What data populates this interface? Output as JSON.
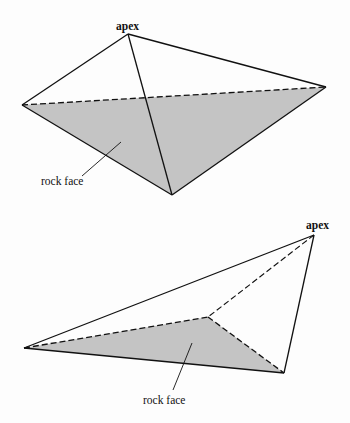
{
  "colors": {
    "face_fill": "#c4c4c4",
    "line": "#111111",
    "background": "#fdfdfd"
  },
  "figures": [
    {
      "name": "top-pyramid",
      "apex_label": "apex",
      "rock_face_label": "rock face",
      "vertices": {
        "apex": [
          128,
          34
        ],
        "left": [
          22,
          105
        ],
        "right": [
          326,
          87
        ],
        "bottom": [
          172,
          195
        ]
      }
    },
    {
      "name": "bottom-pyramid",
      "apex_label": "apex",
      "rock_face_label": "rock face",
      "vertices": {
        "apex": [
          314,
          235
        ],
        "left": [
          24,
          348
        ],
        "middle": [
          208,
          317
        ],
        "right": [
          284,
          373
        ]
      }
    }
  ]
}
